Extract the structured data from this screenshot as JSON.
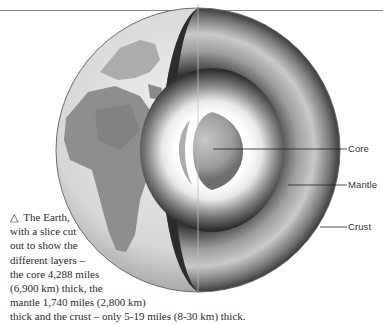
{
  "figure": {
    "labels": [
      {
        "id": "core",
        "text": "Core"
      },
      {
        "id": "mantle",
        "text": "Mantle"
      },
      {
        "id": "crust",
        "text": "Crust"
      }
    ],
    "caption": {
      "marker": "△",
      "lines": [
        "The Earth,",
        "with a slice cut",
        "out to show the",
        "different layers –",
        "the core 4,288 miles",
        "(6,900 km) thick, the",
        "mantle 1,740 miles (2,800 km)",
        "thick and the crust – only 5-19 miles (8-30 km) thick."
      ]
    }
  }
}
